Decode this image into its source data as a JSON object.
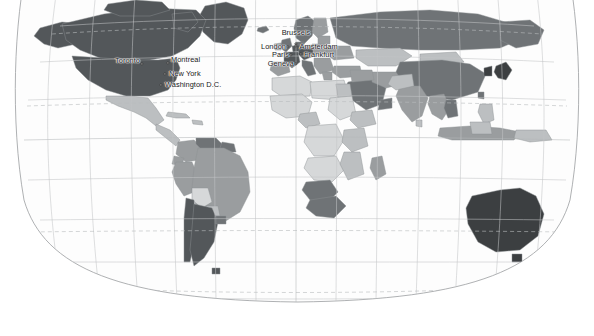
{
  "map": {
    "type": "world-choropleth",
    "projection": "robinson",
    "background_color": "#ffffff",
    "ocean_color": "#fdfdfd",
    "graticule_color": "#c2c4c6",
    "tropic_line_color": "#b9bcbe",
    "border_color": "#9a9d9f",
    "country_outline_color": "#8e9193",
    "legend_shades": {
      "very_dark": "#3c3f41",
      "dark": "#53575a",
      "medium_dark": "#6f7376",
      "medium": "#9a9d9f",
      "light": "#bcbfc1",
      "very_light": "#d6d8d9",
      "lightest": "#e8eaea"
    },
    "graticule": {
      "meridian_spacing_deg": 20,
      "parallel_spacing_deg": 20,
      "tropics_dashed": true,
      "equator_visible": true
    }
  },
  "cities": [
    {
      "name": "Toronto",
      "x": 142.0,
      "y": 64.0,
      "label_x": 140.0,
      "label_y": 61.0,
      "align": "left"
    },
    {
      "name": "Montreal",
      "x": 168.0,
      "y": 62.5,
      "label_x": 171.0,
      "label_y": 60.0,
      "align": "right"
    },
    {
      "name": "New York",
      "x": 165.0,
      "y": 74.0,
      "label_x": 169.0,
      "label_y": 74.0,
      "align": "right"
    },
    {
      "name": "Washington D.C.",
      "x": 161.0,
      "y": 85.0,
      "label_x": 165.0,
      "label_y": 85.0,
      "align": "right"
    },
    {
      "name": "Brussels",
      "x": 296.0,
      "y": 44.0,
      "label_x": 296.0,
      "label_y": 37.0,
      "align": "above"
    },
    {
      "name": "London",
      "x": 288.0,
      "y": 47.0,
      "label_x": 286.0,
      "label_y": 47.0,
      "align": "left"
    },
    {
      "name": "Amsterdam",
      "x": 296.0,
      "y": 45.5,
      "label_x": 299.5,
      "label_y": 46.5,
      "align": "right"
    },
    {
      "name": "Paris",
      "x": 291.0,
      "y": 55.0,
      "label_x": 289.0,
      "label_y": 55.0,
      "align": "left"
    },
    {
      "name": "Frankfurt",
      "x": 301.0,
      "y": 54.0,
      "label_x": 304.0,
      "label_y": 55.0,
      "align": "right"
    },
    {
      "name": "Geneva",
      "x": 296.0,
      "y": 63.5,
      "label_x": 294.0,
      "label_y": 63.5,
      "align": "left"
    }
  ]
}
